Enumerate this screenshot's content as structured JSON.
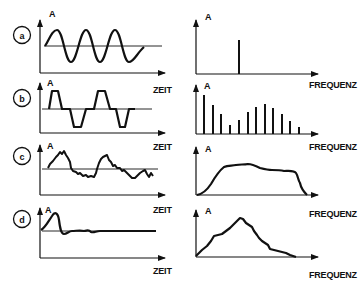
{
  "diagram": {
    "title": "",
    "axis_labels": {
      "amplitude": "A",
      "time": "ZEIT",
      "frequency": "FREQUENZ"
    },
    "rows": [
      {
        "id": "a",
        "label": "a",
        "time_signal": "sine wave",
        "spectrum": "single line"
      },
      {
        "id": "b",
        "label": "b",
        "time_signal": "trapezoidal pulse wave",
        "spectrum": "discrete line spectrum"
      },
      {
        "id": "c",
        "label": "c",
        "time_signal": "random noise-like signal",
        "spectrum": "continuous broadband spectrum"
      },
      {
        "id": "d",
        "label": "d",
        "time_signal": "single transient pulse",
        "spectrum": "continuous triangular spectrum"
      }
    ],
    "line_spectrum_b_relative_heights": [
      1.0,
      0.72,
      0.48,
      0.22,
      0.33,
      0.58,
      0.7,
      0.8,
      0.7,
      0.53,
      0.36,
      0.2
    ],
    "colors": {
      "ink": "#111111",
      "background": "#ffffff"
    }
  }
}
